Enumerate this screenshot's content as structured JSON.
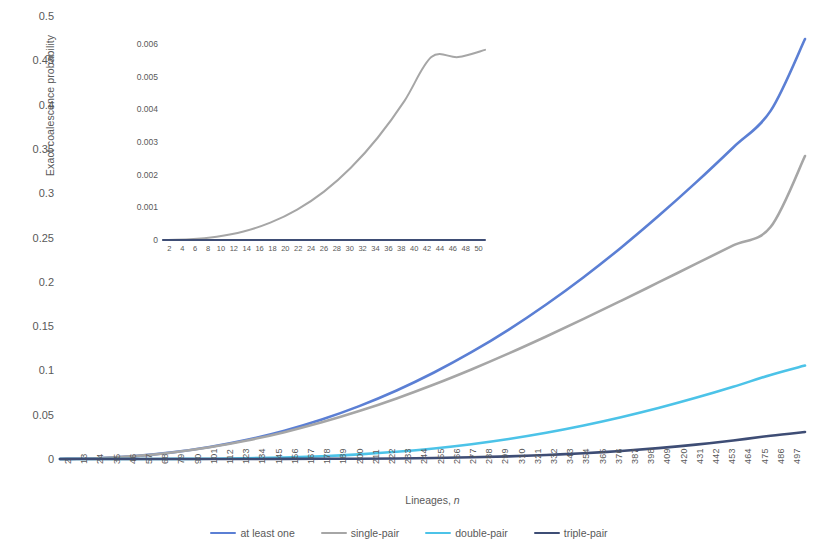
{
  "chart_data": {
    "type": "line",
    "title": "",
    "xlabel": "Lineages, n",
    "ylabel": "Exact coalescence probability",
    "xlim": [
      2,
      500
    ],
    "ylim": [
      0,
      0.5
    ],
    "grid": false,
    "legend_position": "bottom",
    "x_tick_labels": [
      "2",
      "13",
      "24",
      "35",
      "46",
      "57",
      "68",
      "79",
      "90",
      "101",
      "112",
      "123",
      "134",
      "145",
      "156",
      "167",
      "178",
      "189",
      "200",
      "211",
      "222",
      "233",
      "244",
      "255",
      "266",
      "277",
      "288",
      "299",
      "310",
      "321",
      "332",
      "343",
      "354",
      "365",
      "376",
      "387",
      "398",
      "409",
      "420",
      "431",
      "442",
      "453",
      "464",
      "475",
      "486",
      "497"
    ],
    "y_tick_labels": [
      "0",
      "0.05",
      "0.1",
      "0.15",
      "0.2",
      "0.25",
      "0.3",
      "0.35",
      "0.4",
      "0.45",
      "0.5"
    ],
    "y_tick_values": [
      0,
      0.05,
      0.1,
      0.15,
      0.2,
      0.25,
      0.3,
      0.35,
      0.4,
      0.45,
      0.5
    ],
    "x": [
      2,
      27,
      52,
      77,
      102,
      127,
      152,
      177,
      202,
      227,
      252,
      277,
      302,
      327,
      352,
      377,
      402,
      427,
      452,
      477,
      500
    ],
    "series": [
      {
        "name": "at least one",
        "color": "#5b7fd4",
        "values": [
          0.0,
          0.0008,
          0.0033,
          0.0075,
          0.0136,
          0.0217,
          0.032,
          0.0446,
          0.0597,
          0.0773,
          0.0976,
          0.1205,
          0.1461,
          0.1744,
          0.2052,
          0.2385,
          0.2742,
          0.3119,
          0.3516,
          0.3929,
          0.474
        ]
      },
      {
        "name": "single-pair",
        "color": "#a6a6a6",
        "values": [
          0.0,
          0.0008,
          0.0033,
          0.0074,
          0.0133,
          0.0209,
          0.0303,
          0.0414,
          0.0541,
          0.0684,
          0.0841,
          0.1011,
          0.1192,
          0.1383,
          0.1581,
          0.1785,
          0.1993,
          0.2202,
          0.2411,
          0.2618,
          0.342
        ]
      },
      {
        "name": "double-pair",
        "color": "#4cc3e8",
        "values": [
          0.0,
          0.0,
          0.0,
          0.0001,
          0.0003,
          0.0008,
          0.0017,
          0.0031,
          0.0052,
          0.0081,
          0.0119,
          0.0167,
          0.0226,
          0.0296,
          0.0378,
          0.0471,
          0.0575,
          0.069,
          0.0815,
          0.0949,
          0.1055
        ]
      },
      {
        "name": "triple-pair",
        "color": "#3e4d75",
        "values": [
          0.0,
          0.0,
          0.0,
          0.0,
          0.0,
          0.0,
          0.0001,
          0.0002,
          0.0003,
          0.0006,
          0.0011,
          0.0019,
          0.003,
          0.0045,
          0.0065,
          0.0091,
          0.0123,
          0.0162,
          0.0209,
          0.0263,
          0.0305
        ]
      }
    ]
  },
  "inset_chart_data": {
    "type": "line",
    "title": "",
    "xlabel": "",
    "ylabel": "",
    "xlim": [
      2,
      50
    ],
    "ylim": [
      0,
      0.006
    ],
    "grid": false,
    "x_tick_labels": [
      "2",
      "4",
      "6",
      "8",
      "10",
      "12",
      "14",
      "16",
      "18",
      "20",
      "22",
      "24",
      "26",
      "28",
      "30",
      "32",
      "34",
      "36",
      "38",
      "40",
      "42",
      "44",
      "46",
      "48",
      "50"
    ],
    "y_tick_labels": [
      "0",
      "0.001",
      "0.002",
      "0.003",
      "0.004",
      "0.005",
      "0.006"
    ],
    "y_tick_values": [
      0,
      0.001,
      0.002,
      0.003,
      0.004,
      0.005,
      0.006
    ],
    "x": [
      2,
      6,
      10,
      14,
      18,
      22,
      26,
      30,
      34,
      38,
      42,
      46,
      50
    ],
    "series": [
      {
        "name": "single-pair",
        "color": "#a6a6a6",
        "values": [
          0.0,
          2e-05,
          0.0001,
          0.00026,
          0.00053,
          0.00093,
          0.00148,
          0.00221,
          0.00313,
          0.00426,
          0.0056,
          0.0056,
          0.00582
        ]
      },
      {
        "name": "triple-pair",
        "color": "#3e4d75",
        "values": [
          0.0,
          0.0,
          0.0,
          0.0,
          0.0,
          0.0,
          0.0,
          0.0,
          0.0,
          0.0,
          0.0,
          0.0,
          0.0
        ]
      }
    ]
  },
  "axes": {
    "main_y_title": "Exact coalescence probability",
    "main_x_title_prefix": "Lineages, ",
    "main_x_title_var": "n"
  },
  "legend": {
    "items": [
      {
        "label": "at least one",
        "color": "#5b7fd4"
      },
      {
        "label": "single-pair",
        "color": "#a6a6a6"
      },
      {
        "label": "double-pair",
        "color": "#4cc3e8"
      },
      {
        "label": "triple-pair",
        "color": "#3e4d75"
      }
    ]
  }
}
